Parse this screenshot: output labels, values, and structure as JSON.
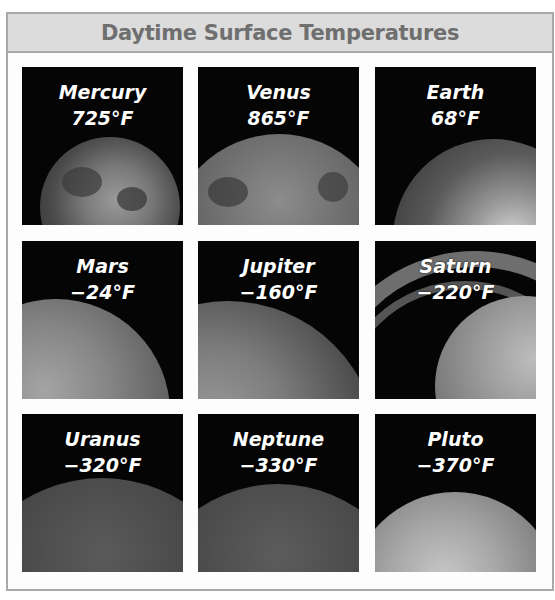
{
  "header": {
    "title": "Daytime Surface Temperatures"
  },
  "planets": [
    {
      "name": "Mercury",
      "temp": "725°F",
      "temp_f": 725
    },
    {
      "name": "Venus",
      "temp": "865°F",
      "temp_f": 865
    },
    {
      "name": "Earth",
      "temp": "68°F",
      "temp_f": 68
    },
    {
      "name": "Mars",
      "temp": "−24°F",
      "temp_f": -24
    },
    {
      "name": "Jupiter",
      "temp": "−160°F",
      "temp_f": -160
    },
    {
      "name": "Saturn",
      "temp": "−220°F",
      "temp_f": -220
    },
    {
      "name": "Uranus",
      "temp": "−320°F",
      "temp_f": -320
    },
    {
      "name": "Neptune",
      "temp": "−330°F",
      "temp_f": -330
    },
    {
      "name": "Pluto",
      "temp": "−370°F",
      "temp_f": -370
    }
  ],
  "colors": {
    "header_bg": "#dcdcdc",
    "header_text": "#6f6f6f",
    "border": "#a9a9a9",
    "tile_bg": "#050505",
    "label_text": "#ffffff"
  }
}
